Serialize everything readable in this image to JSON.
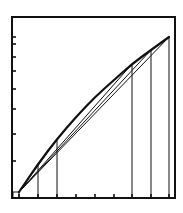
{
  "diagram": {
    "type": "line-diagram",
    "stroke_color": "#111111",
    "background": "#ffffff",
    "frame": {
      "x1": 12,
      "y1": 17,
      "x2": 175,
      "y2": 198
    },
    "origin": {
      "x": 19,
      "y": 192
    },
    "curve_points": [
      [
        19,
        192
      ],
      [
        38,
        164
      ],
      [
        57,
        139
      ],
      [
        76,
        117
      ],
      [
        95,
        97
      ],
      [
        114,
        80
      ],
      [
        132,
        64
      ],
      [
        151,
        50
      ],
      [
        169,
        37
      ]
    ],
    "chord_endpoints": [
      [
        57,
        139
      ],
      [
        132,
        64
      ],
      [
        151,
        50
      ],
      [
        169,
        37
      ]
    ],
    "vertical_lines_x": [
      38,
      57,
      132,
      151,
      169
    ],
    "x_ticks": [
      19,
      38,
      57,
      76,
      95,
      114,
      132,
      151,
      169
    ],
    "y_ticks": [
      37,
      44,
      57,
      71,
      89,
      109,
      134,
      161
    ],
    "labels": []
  }
}
